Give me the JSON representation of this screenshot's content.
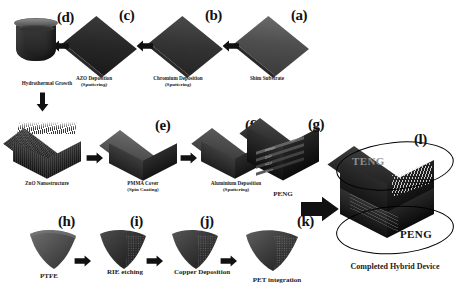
{
  "figure": {
    "background_color": "#ffffff",
    "ink_color": "#111111"
  },
  "rows": {
    "row1": {
      "name": "PENG electrode stack fabrication (right to left)",
      "steps": [
        {
          "letter": "(a)",
          "caption": "Shim Substrate",
          "sub": "",
          "icon": "plate-icon"
        },
        {
          "letter": "(b)",
          "caption": "Chromium Deposition",
          "sub": "(Sputtering)",
          "icon": "plate-icon"
        },
        {
          "letter": "(c)",
          "caption": "AZO Deposition",
          "sub": "(Sputtering)",
          "icon": "plate-icon"
        },
        {
          "letter": "(d)",
          "caption": "Hydrothermal Growth",
          "sub": "",
          "icon": "beaker-icon"
        }
      ]
    },
    "row2": {
      "name": "ZnO nanostructure to PENG (left to right)",
      "steps": [
        {
          "letter": "",
          "caption": "ZnO Nanostructure",
          "sub": "",
          "icon": "nanostructure-block-icon"
        },
        {
          "letter": "(e)",
          "caption": "PMMA Cover",
          "sub": "(Spin Coating)",
          "icon": "smooth-block-icon"
        },
        {
          "letter": "(f)",
          "caption": "Aluminium Deposition",
          "sub": "(Sputtering)",
          "icon": "block-icon"
        },
        {
          "letter": "(g)",
          "caption": "PENG",
          "sub": "",
          "icon": "peng-cutaway-icon"
        }
      ]
    },
    "row3": {
      "name": "TENG layer fabrication (left to right)",
      "steps": [
        {
          "letter": "(h)",
          "caption": "PTFE",
          "sub": "",
          "icon": "curved-sheet-icon"
        },
        {
          "letter": "(i)",
          "caption": "RIE etching",
          "sub": "",
          "icon": "curved-sheet-icon"
        },
        {
          "letter": "(j)",
          "caption": "Copper Deposition",
          "sub": "",
          "icon": "curved-sheet-icon"
        },
        {
          "letter": "(k)",
          "caption": "PET integration",
          "sub": "",
          "icon": "curved-sheet-icon"
        }
      ]
    }
  },
  "final_device": {
    "letter": "(l)",
    "caption": "Completed Hybrid Device",
    "annotations": [
      {
        "label": "TENG",
        "region": "upper"
      },
      {
        "label": "PENG",
        "region": "lower"
      }
    ]
  },
  "peng_internal_layers": [
    "PMMA",
    "ZnO",
    "AZO",
    "Shim"
  ],
  "icons": {
    "arrow_left": "arrow-left-icon",
    "arrow_right": "arrow-right-icon",
    "arrow_down": "arrow-down-icon",
    "arrow_big_right": "arrow-big-right-icon"
  }
}
